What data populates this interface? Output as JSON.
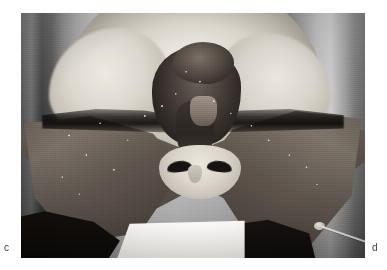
{
  "figure": {
    "kind": "clinical-photograph",
    "modality": "grayscale surgical photograph",
    "labels": {
      "bottom_left": "c",
      "bottom_right": "d"
    },
    "frame": {
      "left": 21,
      "top": 13,
      "width": 344,
      "height": 245
    },
    "palette": {
      "page_background": "#ffffff",
      "label_text": "#3a3a3a",
      "photo_highlight": "#f2efe9",
      "photo_midtone": "#8e8e8e",
      "photo_shadow": "#1b1715",
      "photo_black": "#0a0806",
      "drape_white": "#fbfaf8"
    },
    "regions": [
      {
        "name": "upper-face-highlight",
        "tone": "bright"
      },
      {
        "name": "left-degloved-flap",
        "tone": "mid-dark"
      },
      {
        "name": "right-degloved-flap",
        "tone": "mid-dark"
      },
      {
        "name": "central-necrotic-mass",
        "tone": "dark"
      },
      {
        "name": "nose-and-nostrils",
        "tone": "bright-with-black-apertures"
      },
      {
        "name": "surgical-drape",
        "tone": "white"
      },
      {
        "name": "suture-probe",
        "tone": "thin-white-line"
      },
      {
        "name": "background-drapes",
        "tone": "vertical-grey-bands"
      }
    ]
  }
}
